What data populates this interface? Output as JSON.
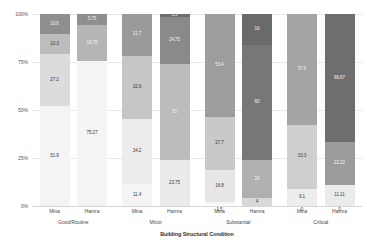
{
  "chart_data": {
    "type": "bar",
    "subtype": "stacked-100-percent",
    "title": "",
    "xlabel": "Building Structural Condition",
    "ylabel": "",
    "ylim": [
      0,
      100
    ],
    "yticks": [
      "0%",
      "25%",
      "50%",
      "75%",
      "100%"
    ],
    "ytick_values": [
      0,
      25,
      50,
      75,
      100
    ],
    "grid": true,
    "legend": "none",
    "groups": [
      "Good/Routine",
      "Minor",
      "Substantial",
      "Critical"
    ],
    "categories": [
      "Mina",
      "Hamra",
      "Mina",
      "Hamra",
      "Mina",
      "Hamra",
      "Mina",
      "Hamra"
    ],
    "series": [
      {
        "name": "Segment 1",
        "color": "#f4f4f4",
        "values": [
          51.9,
          75.27,
          11.4,
          23.75,
          1.5,
          4,
          0,
          11.11
        ]
      },
      {
        "name": "Segment 2",
        "color": "#dcdcdc",
        "values": [
          27.2,
          18.78,
          34.2,
          50,
          16.8,
          20,
          9.1,
          0
        ]
      },
      {
        "name": "Segment 3",
        "color": "#bdbdbd",
        "values": [
          10.3,
          5.75,
          32.9,
          24.75,
          27.7,
          60,
          33.3,
          22.22
        ]
      },
      {
        "name": "Segment 4",
        "color": "#8f8f8f",
        "values": [
          10.6,
          0.11,
          21.7,
          1.5,
          53.4,
          16,
          57.6,
          66.67
        ]
      }
    ],
    "bars": [
      {
        "group": "Good/Routine",
        "category": "Mina",
        "segments": [
          {
            "label": "51.9",
            "value": 51.9,
            "color": "#f4f4f4",
            "text": "light"
          },
          {
            "label": "27.2",
            "value": 27.2,
            "color": "#dcdcdc",
            "text": "light"
          },
          {
            "label": "10.3",
            "value": 10.3,
            "color": "#bdbdbd",
            "text": "light"
          },
          {
            "label": "10.6",
            "value": 10.6,
            "color": "#8f8f8f",
            "text": "dark"
          }
        ]
      },
      {
        "group": "Good/Routine",
        "category": "Hamra",
        "segments": [
          {
            "label": "75.27",
            "value": 75.27,
            "color": "#f4f4f4",
            "text": "light"
          },
          {
            "label": "18.78",
            "value": 18.78,
            "color": "#b5b5b5",
            "text": "dark"
          },
          {
            "label": "5.75",
            "value": 5.75,
            "color": "#8f8f8f",
            "text": "dark"
          },
          {
            "label": "0.11",
            "value": 0.11,
            "color": "#6e6e6e",
            "text": "dark"
          }
        ]
      },
      {
        "group": "Minor",
        "category": "Mina",
        "segments": [
          {
            "label": "11.4",
            "value": 11.4,
            "color": "#f4f4f4",
            "text": "light"
          },
          {
            "label": "34.2",
            "value": 34.2,
            "color": "#ececec",
            "text": "light"
          },
          {
            "label": "32.9",
            "value": 32.9,
            "color": "#c6c6c6",
            "text": "light"
          },
          {
            "label": "21.7",
            "value": 21.7,
            "color": "#9a9a9a",
            "text": "dark"
          }
        ]
      },
      {
        "group": "Minor",
        "category": "Hamra",
        "segments": [
          {
            "label": "23.75",
            "value": 23.75,
            "color": "#eaeaea",
            "text": "light"
          },
          {
            "label": "50",
            "value": 50,
            "color": "#bcbcbc",
            "text": "dark"
          },
          {
            "label": "24.75",
            "value": 24.75,
            "color": "#8a8a8a",
            "text": "dark"
          },
          {
            "label": "1.5",
            "value": 1.5,
            "color": "#6e6e6e",
            "text": "dark"
          }
        ]
      },
      {
        "group": "Substantial",
        "category": "Mina",
        "segments": [
          {
            "label": "1.5",
            "value": 1.5,
            "color": "#f6f6f6",
            "text": "light",
            "outside": true
          },
          {
            "label": "16.8",
            "value": 16.8,
            "color": "#e6e6e6",
            "text": "light"
          },
          {
            "label": "27.7",
            "value": 27.7,
            "color": "#c9c9c9",
            "text": "light"
          },
          {
            "label": "53.4",
            "value": 53.4,
            "color": "#9d9d9d",
            "text": "dark"
          }
        ]
      },
      {
        "group": "Substantial",
        "category": "Hamra",
        "segments": [
          {
            "label": "4",
            "value": 4,
            "color": "#d8d8d8",
            "text": "light"
          },
          {
            "label": "20",
            "value": 20,
            "color": "#b0b0b0",
            "text": "dark"
          },
          {
            "label": "60",
            "value": 60,
            "color": "#777777",
            "text": "dark"
          },
          {
            "label": "16",
            "value": 16,
            "color": "#6a6a6a",
            "text": "dark"
          }
        ]
      },
      {
        "group": "Critical",
        "category": "Mina",
        "segments": [
          {
            "label": "0",
            "value": 0,
            "color": "#f6f6f6",
            "text": "light",
            "outside": true
          },
          {
            "label": "9.1",
            "value": 9.1,
            "color": "#ededed",
            "text": "light"
          },
          {
            "label": "33.3",
            "value": 33.3,
            "color": "#cfcfcf",
            "text": "light"
          },
          {
            "label": "57.6",
            "value": 57.6,
            "color": "#a4a4a4",
            "text": "dark"
          }
        ]
      },
      {
        "group": "Critical",
        "category": "Hamra",
        "segments": [
          {
            "label": "11.11",
            "value": 11.11,
            "color": "#ebebeb",
            "text": "light"
          },
          {
            "label": "0",
            "value": 0,
            "color": "#dddddd",
            "text": "light",
            "outside": true
          },
          {
            "label": "22.22",
            "value": 22.22,
            "color": "#9c9c9c",
            "text": "dark"
          },
          {
            "label": "66.67",
            "value": 66.67,
            "color": "#6e6e6e",
            "text": "dark"
          }
        ]
      }
    ]
  }
}
